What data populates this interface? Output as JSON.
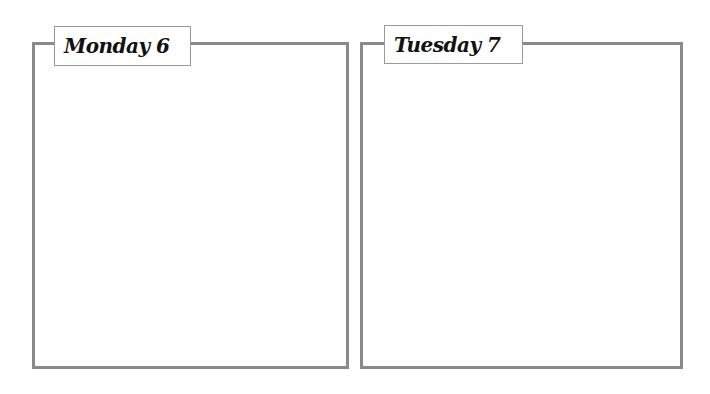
{
  "days": [
    {
      "label": "Monday 6"
    },
    {
      "label": "Tuesday 7"
    }
  ],
  "colors": {
    "border": "#8a8a8a",
    "label_border": "#9a9a9a",
    "text": "#111111",
    "background": "#ffffff"
  }
}
